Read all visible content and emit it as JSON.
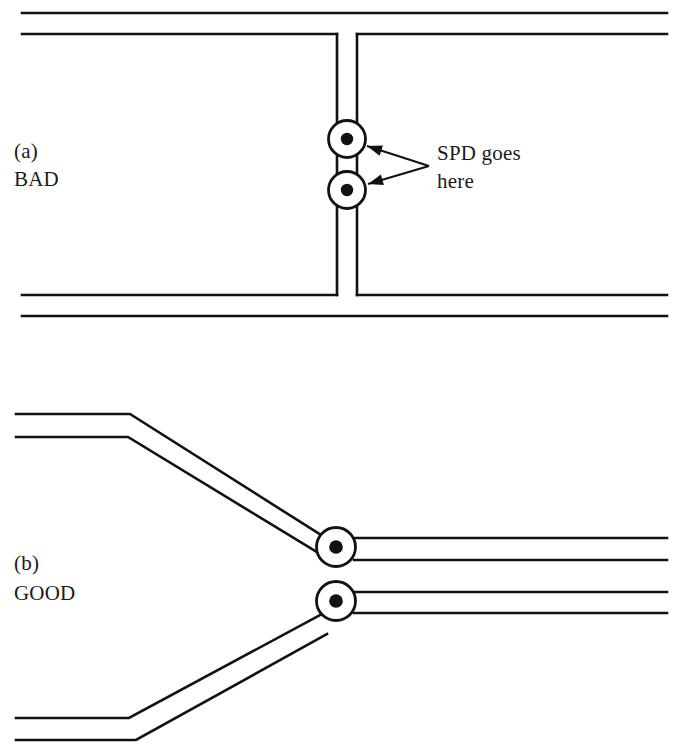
{
  "figure": {
    "background_color": "#ffffff",
    "line_color": "#121212",
    "width": 679,
    "height": 755
  },
  "panels": [
    {
      "id": "a",
      "tag": "(a)",
      "verdict": "BAD",
      "tag_x": 14,
      "tag_y": 158,
      "verdict_x": 14,
      "verdict_y": 186,
      "description": "Straight-through bus with long stub leads to the SPD nodes"
    },
    {
      "id": "b",
      "tag": "(b)",
      "verdict": "GOOD",
      "tag_x": 14,
      "tag_y": 570,
      "verdict_x": 14,
      "verdict_y": 600,
      "description": "Conductors routed directly through the SPD nodes with short leads"
    }
  ],
  "annotation": {
    "line_1": "SPD goes",
    "line_2": "here",
    "text_x": 437,
    "line_1_y": 160,
    "line_2_y": 188,
    "arrow_origin_x": 429,
    "arrow_origin_y": 166,
    "targets": [
      {
        "x": 367,
        "y": 146
      },
      {
        "x": 368,
        "y": 184
      }
    ]
  },
  "nodes": [
    {
      "name": "spd-node-a-upper",
      "panel": "a",
      "cx": 347,
      "cy": 139,
      "r": 18.5,
      "dot_r": 6.2
    },
    {
      "name": "spd-node-a-lower",
      "panel": "a",
      "cx": 347,
      "cy": 190,
      "r": 18.5,
      "dot_r": 6.2
    },
    {
      "name": "spd-node-b-upper",
      "panel": "b",
      "cx": 336,
      "cy": 547,
      "r": 19.5,
      "dot_r": 6.8
    },
    {
      "name": "spd-node-b-lower",
      "panel": "b",
      "cx": 336,
      "cy": 601,
      "r": 19.5,
      "dot_r": 6.8
    }
  ],
  "wires_panel_a": [
    {
      "name": "bus-top-outer",
      "d": "M 22 13 L 667 13"
    },
    {
      "name": "bus-top-inner-left",
      "d": "M 22 34 L 337 34"
    },
    {
      "name": "bus-top-inner-right",
      "d": "M 357 34 L 667 34"
    },
    {
      "name": "stub-left-vertical",
      "d": "M 337 34 L 337 295"
    },
    {
      "name": "stub-right-vertical",
      "d": "M 357 34 L 357 295"
    },
    {
      "name": "bus-bottom-inner-left",
      "d": "M 22 295 L 337 295"
    },
    {
      "name": "bus-bottom-inner-right",
      "d": "M 357 295 L 667 295"
    },
    {
      "name": "bus-bottom-outer",
      "d": "M 22 316 L 667 316"
    }
  ],
  "wires_panel_b": [
    {
      "name": "upper-pair-outer",
      "d": "M 16 414 L 130 414 L 321 535"
    },
    {
      "name": "upper-pair-inner",
      "d": "M 16 437 L 128 437 L 325 557"
    },
    {
      "name": "lower-pair-inner",
      "d": "M 16 718 L 129 718 L 322 614"
    },
    {
      "name": "lower-pair-outer",
      "d": "M 16 740 L 136 740 L 327 634"
    },
    {
      "name": "out-upper-outer",
      "d": "M 354 538 L 667 538"
    },
    {
      "name": "out-upper-inner",
      "d": "M 354 560 L 667 560"
    },
    {
      "name": "out-lower-inner",
      "d": "M 354 592 L 667 592"
    },
    {
      "name": "out-lower-outer",
      "d": "M 354 613 L 667 613"
    }
  ]
}
